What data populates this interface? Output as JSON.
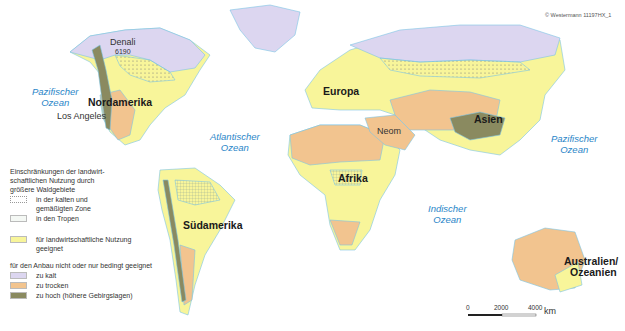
{
  "copyright": "© Westermann 11197HX_1",
  "continents": [
    {
      "name": "Nordamerika",
      "x": 88,
      "y": 96
    },
    {
      "name": "Südamerika",
      "x": 183,
      "y": 219
    },
    {
      "name": "Europa",
      "x": 323,
      "y": 85
    },
    {
      "name": "Afrika",
      "x": 338,
      "y": 172
    },
    {
      "name": "Asien",
      "x": 474,
      "y": 113
    },
    {
      "name": "Australien/",
      "x": 564,
      "y": 255
    },
    {
      "name": "Ozeanien",
      "x": 570,
      "y": 266
    }
  ],
  "oceans": [
    {
      "line1": "Pazifischer",
      "line2": "Ozean",
      "x": 32,
      "y": 86
    },
    {
      "line1": "Atlantischer",
      "line2": "Ozean",
      "x": 210,
      "y": 131
    },
    {
      "line1": "Indischer",
      "line2": "Ozean",
      "x": 428,
      "y": 203
    },
    {
      "line1": "Pazifischer",
      "line2": "Ozean",
      "x": 551,
      "y": 133
    }
  ],
  "places": [
    {
      "name": "Los Angeles",
      "x": 60,
      "y": 111
    },
    {
      "name": "Neom",
      "x": 377,
      "y": 126
    },
    {
      "name": "Denali",
      "x": 110,
      "y": 37
    },
    {
      "name": "6190",
      "x": 115,
      "y": 49
    }
  ],
  "legend": {
    "forest_title": "Einschränkungen der landwirt-\nschaftlichen Nutzung durch\ngrößere Waldgebiete",
    "forest_items": [
      {
        "label": "in der kalten und",
        "label2": "gemäßigten Zone",
        "pattern": "dots"
      },
      {
        "label": "in den Tropen",
        "pattern": "grid"
      }
    ],
    "suitable": {
      "label": "für landwirtschaftliche Nutzung",
      "label2": "geeignet",
      "color": "#f8f59a"
    },
    "unsuitable_title": "für den Anbau nicht oder nur bedingt geeignet",
    "unsuitable_items": [
      {
        "label": "zu kalt",
        "color": "#dcd6f0"
      },
      {
        "label": "zu trocken",
        "color": "#f2c48f"
      },
      {
        "label": "zu hoch (höhere Gebirgslagen)",
        "color": "#8a8a60"
      }
    ]
  },
  "scale_bar": {
    "ticks": [
      "0",
      "2000",
      "4000"
    ],
    "unit": "km"
  },
  "colors": {
    "cold": "#dcd6f0",
    "dry": "#f2c48f",
    "high": "#8a8a60",
    "suitable": "#f8f59a",
    "water_outline": "#7cc4e4",
    "ocean_label": "#2a86c8"
  }
}
